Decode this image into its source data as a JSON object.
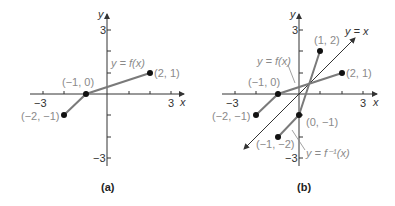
{
  "panels": [
    {
      "id": "a",
      "caption": "(a)",
      "axes": {
        "x_label": "x",
        "y_label": "y",
        "x_ticks": [
          "-3",
          "3"
        ],
        "y_ticks": [
          "3",
          "-3"
        ],
        "range": [
          -3,
          3
        ]
      },
      "curve_label": "y = f(x)",
      "points": [
        {
          "label": "(−2, −1)",
          "x": -2,
          "y": -1
        },
        {
          "label": "(−1, 0)",
          "x": -1,
          "y": 0
        },
        {
          "label": "(2, 1)",
          "x": 2,
          "y": 1
        }
      ]
    },
    {
      "id": "b",
      "caption": "(b)",
      "axes": {
        "x_label": "x",
        "y_label": "y",
        "x_ticks": [
          "-3",
          "3"
        ],
        "y_ticks": [
          "3",
          "-3"
        ],
        "range": [
          -3,
          3
        ]
      },
      "identity_label": "y = x",
      "f_label": "y = f(x)",
      "finv_label": "y = f⁻¹(x)",
      "f_points": [
        {
          "label": "(−2, −1)",
          "x": -2,
          "y": -1
        },
        {
          "label": "(−1, 0)",
          "x": -1,
          "y": 0
        },
        {
          "label": "(2, 1)",
          "x": 2,
          "y": 1
        }
      ],
      "finv_points": [
        {
          "label": "(−1, −2)",
          "x": -1,
          "y": -2
        },
        {
          "label": "(0, −1)",
          "x": 0,
          "y": -1
        },
        {
          "label": "(1, 2)",
          "x": 1,
          "y": 2
        }
      ]
    }
  ],
  "labels": {
    "a_caption": "(a)",
    "b_caption": "(b)",
    "x": "x",
    "y": "y",
    "neg3": "−3",
    "pos3": "3",
    "a_curve": "y = f(x)",
    "a_p1": "(−2, −1)",
    "a_p2": "(−1, 0)",
    "a_p3": "(2, 1)",
    "b_identity": "y = x",
    "b_f": "y = f(x)",
    "b_finv": "y = f⁻¹(x)",
    "b_p1": "(−2, −1)",
    "b_p2": "(−1, 0)",
    "b_p3": "(2, 1)",
    "b_q1": "(−1, −2)",
    "b_q2": "(0, −1)",
    "b_q3": "(1, 2)"
  },
  "colors": {
    "axis": "#333333",
    "graph": "#7a7a7a",
    "label": "#8a8a8a",
    "identity": "#333333"
  }
}
